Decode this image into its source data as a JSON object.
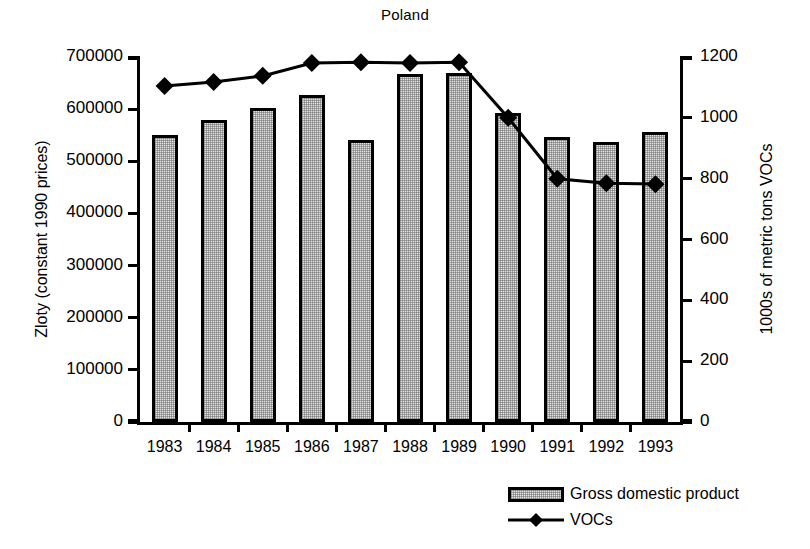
{
  "chart_data": {
    "type": "bar",
    "title": "Poland",
    "xlabel": "",
    "ylabel": "Zloty (constant 1990 prices)",
    "ylabel_right": "1000s of metric tons VOCs",
    "categories": [
      "1983",
      "1984",
      "1985",
      "1986",
      "1987",
      "1988",
      "1989",
      "1990",
      "1991",
      "1992",
      "1993"
    ],
    "ylim": [
      0,
      700000
    ],
    "yticks": [
      "0",
      "100000",
      "200000",
      "300000",
      "400000",
      "500000",
      "600000",
      "700000"
    ],
    "ytick_values": [
      0,
      100000,
      200000,
      300000,
      400000,
      500000,
      600000,
      700000
    ],
    "ylim_right": [
      0,
      1200
    ],
    "yticks_right": [
      "0",
      "200",
      "400",
      "600",
      "800",
      "1000",
      "1200"
    ],
    "ytick_values_right": [
      0,
      200,
      400,
      600,
      800,
      1000,
      1200
    ],
    "grid": false,
    "legend_position": "bottom-right",
    "series": [
      {
        "name": "Gross domestic product",
        "kind": "bar",
        "axis": "left",
        "values": [
          550000,
          580000,
          602000,
          627000,
          541000,
          668000,
          670000,
          592000,
          547000,
          537000,
          556000
        ]
      },
      {
        "name": "VOCs",
        "kind": "line",
        "axis": "right",
        "marker": "diamond",
        "values": [
          1105,
          1118,
          1138,
          1180,
          1183,
          1180,
          1183,
          1000,
          800,
          785,
          782
        ]
      }
    ]
  },
  "legend": {
    "items": [
      {
        "label": "Gross domestic product",
        "swatch": "bar-swatch"
      },
      {
        "label": "VOCs",
        "swatch": "line-diamond-swatch"
      }
    ]
  },
  "colors": {
    "ink": "#000000",
    "bar_fill": "#e3e3e3",
    "background": "#ffffff"
  }
}
